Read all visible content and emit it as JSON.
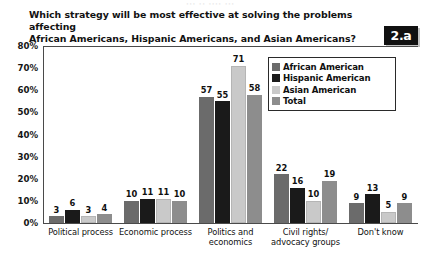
{
  "page": {
    "cut_off_header": "··· ·· ···· ···",
    "badge": "2.a"
  },
  "title": {
    "line1": "Which strategy will be most effective at solving the problems affecting",
    "line2": "African Americans, Hispanic Americans, and Asian Americans?"
  },
  "legend": {
    "items": [
      {
        "label": "African American",
        "color": "#6b6b6b"
      },
      {
        "label": "Hispanic American",
        "color": "#1a1a1a"
      },
      {
        "label": "Asian American",
        "color": "#c9c9c9"
      },
      {
        "label": "Total",
        "color": "#8d8d8d"
      }
    ]
  },
  "axis": {
    "yticks": [
      "80%",
      "70%",
      "60%",
      "50%",
      "40%",
      "30%",
      "20%",
      "10%",
      "0%"
    ]
  },
  "chart_data": {
    "type": "bar",
    "title": "Which strategy will be most effective at solving the problems affecting African Americans, Hispanic Americans, and Asian Americans?",
    "xlabel": "",
    "ylabel": "",
    "ylim": [
      0,
      80
    ],
    "ytick_values": [
      0,
      10,
      20,
      30,
      40,
      50,
      60,
      70,
      80
    ],
    "ytick_labels": [
      "0%",
      "10%",
      "20%",
      "30%",
      "40%",
      "50%",
      "60%",
      "70%",
      "80%"
    ],
    "grid": false,
    "legend_position": "top-right-inside",
    "value_labels": true,
    "categories": [
      "Political process",
      "Economic process",
      "Politics and economics",
      "Civil rights/ advocacy groups",
      "Don't know"
    ],
    "category_label_lines": [
      [
        "Political process"
      ],
      [
        "Economic process"
      ],
      [
        "Politics and",
        "economics"
      ],
      [
        "Civil rights/",
        "advocacy groups"
      ],
      [
        "Don't know"
      ]
    ],
    "series": [
      {
        "name": "African American",
        "color": "#6b6b6b",
        "values": [
          3,
          10,
          57,
          22,
          9
        ]
      },
      {
        "name": "Hispanic American",
        "color": "#1a1a1a",
        "values": [
          6,
          11,
          55,
          16,
          13
        ]
      },
      {
        "name": "Asian American",
        "color": "#c9c9c9",
        "values": [
          3,
          11,
          71,
          10,
          5
        ]
      },
      {
        "name": "Total",
        "color": "#8d8d8d",
        "values": [
          4,
          10,
          58,
          19,
          9
        ]
      }
    ]
  }
}
